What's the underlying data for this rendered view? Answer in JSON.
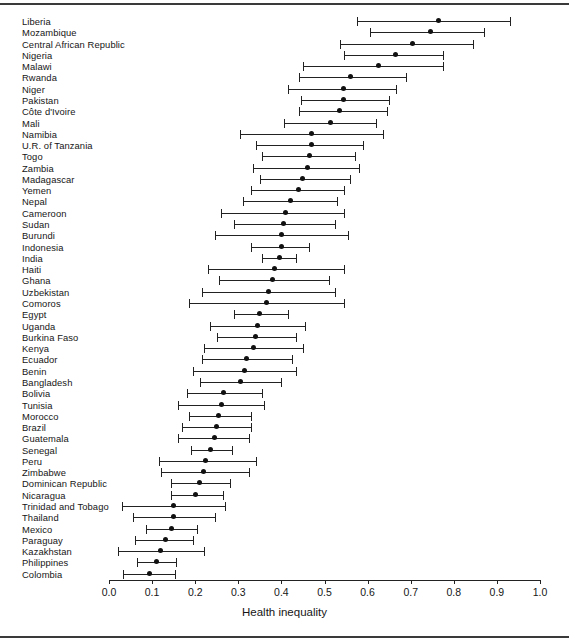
{
  "figure": {
    "title": "",
    "top_rule": true,
    "bottom_rule": true
  },
  "axis": {
    "title": "Health inequality",
    "ticks": [
      "0.0",
      "0.1",
      "0.2",
      "0.3",
      "0.4",
      "0.5",
      "0.6",
      "0.7",
      "0.8",
      "0.9",
      "1.0"
    ],
    "tick_values": [
      0.0,
      0.1,
      0.2,
      0.3,
      0.4,
      0.5,
      0.6,
      0.7,
      0.8,
      0.9,
      1.0
    ],
    "min": 0.0,
    "max": 1.0
  },
  "style": {
    "marker_color": "#111111",
    "line_color": "#222222",
    "text_color": "#161616",
    "background": "#ffffff"
  },
  "chart_data": {
    "type": "scatter",
    "subtype": "dot-plot-with-error-bars",
    "title": "",
    "xlabel": "Health inequality",
    "ylabel": "",
    "xlim": [
      0.0,
      1.0
    ],
    "grid": false,
    "legend": null,
    "orientation": "horizontal",
    "categories": [
      "Liberia",
      "Mozambique",
      "Central African Republic",
      "Nigeria",
      "Malawi",
      "Rwanda",
      "Niger",
      "Pakistan",
      "Côte d'Ivoire",
      "Mali",
      "Namibia",
      "U.R. of Tanzania",
      "Togo",
      "Zambia",
      "Madagascar",
      "Yemen",
      "Nepal",
      "Cameroon",
      "Sudan",
      "Burundi",
      "Indonesia",
      "India",
      "Haiti",
      "Ghana",
      "Uzbekistan",
      "Comoros",
      "Egypt",
      "Uganda",
      "Burkina Faso",
      "Kenya",
      "Ecuador",
      "Benin",
      "Bangladesh",
      "Bolivia",
      "Tunisia",
      "Morocco",
      "Brazil",
      "Guatemala",
      "Senegal",
      "Peru",
      "Zimbabwe",
      "Dominican Republic",
      "Nicaragua",
      "Trinidad and Tobago",
      "Thailand",
      "Mexico",
      "Paraguay",
      "Kazakhstan",
      "Philippines",
      "Colombia"
    ],
    "series": [
      {
        "name": "Health inequality estimate",
        "point_label": "estimate",
        "low_label": "lower bound",
        "high_label": "upper bound",
        "points": [
          {
            "country": "Liberia",
            "estimate": 0.765,
            "low": 0.575,
            "high": 0.93
          },
          {
            "country": "Mozambique",
            "estimate": 0.745,
            "low": 0.605,
            "high": 0.87
          },
          {
            "country": "Central African Republic",
            "estimate": 0.705,
            "low": 0.535,
            "high": 0.845
          },
          {
            "country": "Nigeria",
            "estimate": 0.665,
            "low": 0.545,
            "high": 0.775
          },
          {
            "country": "Malawi",
            "estimate": 0.625,
            "low": 0.45,
            "high": 0.775
          },
          {
            "country": "Rwanda",
            "estimate": 0.56,
            "low": 0.44,
            "high": 0.69
          },
          {
            "country": "Niger",
            "estimate": 0.545,
            "low": 0.415,
            "high": 0.665
          },
          {
            "country": "Pakistan",
            "estimate": 0.545,
            "low": 0.445,
            "high": 0.65
          },
          {
            "country": "Côte d'Ivoire",
            "estimate": 0.535,
            "low": 0.44,
            "high": 0.645
          },
          {
            "country": "Mali",
            "estimate": 0.515,
            "low": 0.405,
            "high": 0.62
          },
          {
            "country": "Namibia",
            "estimate": 0.47,
            "low": 0.305,
            "high": 0.635
          },
          {
            "country": "U.R. of Tanzania",
            "estimate": 0.47,
            "low": 0.34,
            "high": 0.59
          },
          {
            "country": "Togo",
            "estimate": 0.465,
            "low": 0.355,
            "high": 0.57
          },
          {
            "country": "Zambia",
            "estimate": 0.46,
            "low": 0.335,
            "high": 0.58
          },
          {
            "country": "Madagascar",
            "estimate": 0.45,
            "low": 0.35,
            "high": 0.56
          },
          {
            "country": "Yemen",
            "estimate": 0.44,
            "low": 0.33,
            "high": 0.545
          },
          {
            "country": "Nepal",
            "estimate": 0.42,
            "low": 0.31,
            "high": 0.53
          },
          {
            "country": "Cameroon",
            "estimate": 0.41,
            "low": 0.26,
            "high": 0.545
          },
          {
            "country": "Sudan",
            "estimate": 0.405,
            "low": 0.29,
            "high": 0.525
          },
          {
            "country": "Burundi",
            "estimate": 0.4,
            "low": 0.245,
            "high": 0.555
          },
          {
            "country": "Indonesia",
            "estimate": 0.4,
            "low": 0.33,
            "high": 0.465
          },
          {
            "country": "India",
            "estimate": 0.395,
            "low": 0.355,
            "high": 0.435
          },
          {
            "country": "Haiti",
            "estimate": 0.385,
            "low": 0.23,
            "high": 0.545
          },
          {
            "country": "Ghana",
            "estimate": 0.38,
            "low": 0.255,
            "high": 0.51
          },
          {
            "country": "Uzbekistan",
            "estimate": 0.37,
            "low": 0.215,
            "high": 0.525
          },
          {
            "country": "Comoros",
            "estimate": 0.365,
            "low": 0.185,
            "high": 0.545
          },
          {
            "country": "Egypt",
            "estimate": 0.35,
            "low": 0.29,
            "high": 0.415
          },
          {
            "country": "Uganda",
            "estimate": 0.345,
            "low": 0.235,
            "high": 0.455
          },
          {
            "country": "Burkina Faso",
            "estimate": 0.34,
            "low": 0.25,
            "high": 0.435
          },
          {
            "country": "Kenya",
            "estimate": 0.335,
            "low": 0.22,
            "high": 0.45
          },
          {
            "country": "Ecuador",
            "estimate": 0.32,
            "low": 0.215,
            "high": 0.425
          },
          {
            "country": "Benin",
            "estimate": 0.315,
            "low": 0.195,
            "high": 0.435
          },
          {
            "country": "Bangladesh",
            "estimate": 0.305,
            "low": 0.21,
            "high": 0.4
          },
          {
            "country": "Bolivia",
            "estimate": 0.265,
            "low": 0.18,
            "high": 0.355
          },
          {
            "country": "Tunisia",
            "estimate": 0.26,
            "low": 0.16,
            "high": 0.36
          },
          {
            "country": "Morocco",
            "estimate": 0.255,
            "low": 0.185,
            "high": 0.33
          },
          {
            "country": "Brazil",
            "estimate": 0.25,
            "low": 0.17,
            "high": 0.33
          },
          {
            "country": "Guatemala",
            "estimate": 0.245,
            "low": 0.16,
            "high": 0.325
          },
          {
            "country": "Senegal",
            "estimate": 0.235,
            "low": 0.19,
            "high": 0.285
          },
          {
            "country": "Peru",
            "estimate": 0.225,
            "low": 0.115,
            "high": 0.34
          },
          {
            "country": "Zimbabwe",
            "estimate": 0.22,
            "low": 0.12,
            "high": 0.325
          },
          {
            "country": "Dominican Republic",
            "estimate": 0.21,
            "low": 0.145,
            "high": 0.28
          },
          {
            "country": "Nicaragua",
            "estimate": 0.2,
            "low": 0.145,
            "high": 0.265
          },
          {
            "country": "Trinidad and Tobago",
            "estimate": 0.15,
            "low": 0.03,
            "high": 0.27
          },
          {
            "country": "Thailand",
            "estimate": 0.15,
            "low": 0.055,
            "high": 0.245
          },
          {
            "country": "Mexico",
            "estimate": 0.145,
            "low": 0.085,
            "high": 0.205
          },
          {
            "country": "Paraguay",
            "estimate": 0.13,
            "low": 0.06,
            "high": 0.195
          },
          {
            "country": "Kazakhstan",
            "estimate": 0.12,
            "low": 0.02,
            "high": 0.22
          },
          {
            "country": "Philippines",
            "estimate": 0.11,
            "low": 0.065,
            "high": 0.155
          },
          {
            "country": "Colombia",
            "estimate": 0.093,
            "low": 0.032,
            "high": 0.153
          }
        ]
      }
    ]
  }
}
